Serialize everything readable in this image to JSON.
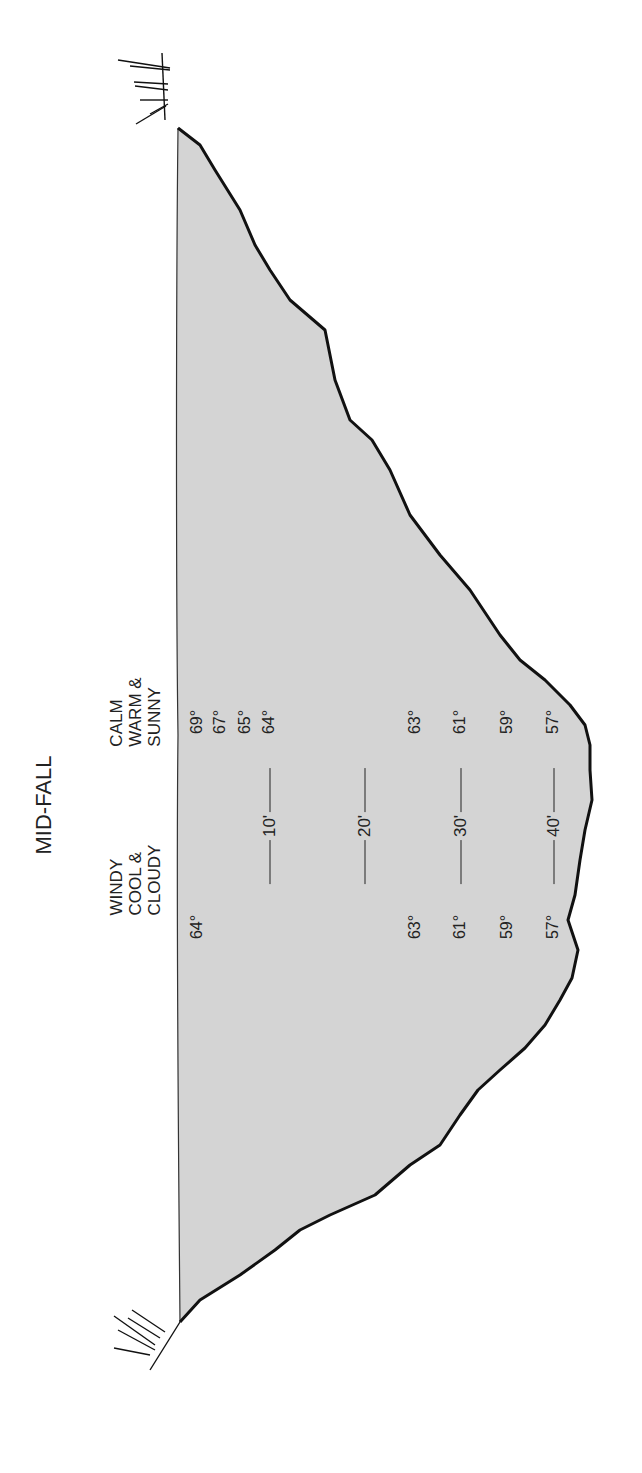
{
  "title": "MID-FALL",
  "conditions": {
    "left": "WINDY\nCOOL &\nCLOUDY",
    "right": "CALM\nWARM &\nSUNNY"
  },
  "depth_markers": [
    "10'",
    "20'",
    "30'",
    "40'"
  ],
  "temperatures": {
    "windy_cool_cloudy": {
      "surface": "64°",
      "20ft": "63°",
      "30ft": "61°",
      "35ft": "59°",
      "40ft": "57°"
    },
    "calm_warm_sunny": {
      "surface": "69°",
      "near_surface_1": "67°",
      "near_surface_2": "65°",
      "10ft": "64°",
      "20ft": "63°",
      "30ft": "61°",
      "35ft": "59°",
      "40ft": "57°"
    }
  },
  "colors": {
    "water": "#d4d4d4",
    "shore": "#1a1a1a",
    "background": "#ffffff"
  }
}
